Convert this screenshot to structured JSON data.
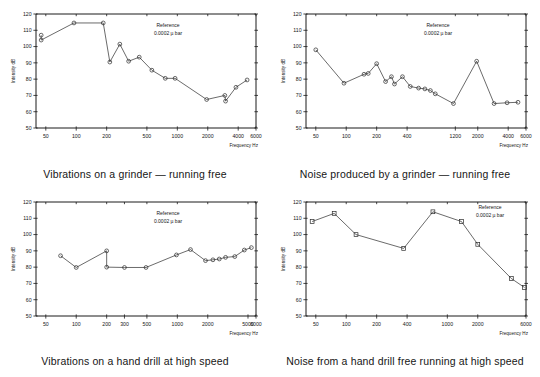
{
  "page": {
    "background": "#ffffff",
    "ink": "#1a1a1a"
  },
  "common": {
    "reference_line1": "Reference",
    "reference_line2": "0.0002 µ bar",
    "x_axis_title": "Frequency Hz",
    "y_axis_title": "Intensity dB"
  },
  "panels": [
    {
      "id": "vibrations-grinder",
      "caption": "Vibrations on a grinder — running free"
    },
    {
      "id": "noise-grinder",
      "caption": "Noise produced by a grinder — running free"
    },
    {
      "id": "vibrations-hand-drill",
      "caption": "Vibrations on a hand drill at high speed"
    },
    {
      "id": "noise-hand-drill",
      "caption": "Noise from a hand drill free running at high speed"
    }
  ],
  "chart_data": [
    {
      "type": "line",
      "title": "Vibrations on a grinder — running free",
      "xlabel": "Frequency Hz",
      "ylabel": "Intensity dB",
      "xscale": "log",
      "xlim": [
        40,
        6000
      ],
      "ylim": [
        50,
        120
      ],
      "yticks": [
        50,
        60,
        70,
        80,
        90,
        100,
        110,
        120
      ],
      "xticks": [
        50,
        100,
        200,
        500,
        1000,
        2000,
        4000,
        6000
      ],
      "xticklabels": [
        "50",
        "100",
        "200",
        "500",
        "1000",
        "2000",
        "4000",
        "6000"
      ],
      "grid": false,
      "legend": null,
      "annotations": [
        "Reference",
        "0.0002 µ bar"
      ],
      "markers": "open-circle",
      "x": [
        45,
        45,
        95,
        185,
        215,
        270,
        330,
        420,
        560,
        760,
        950,
        1950,
        2950,
        3000,
        3800,
        4900
      ],
      "y": [
        107,
        104,
        114.5,
        114.5,
        90.5,
        101.5,
        91,
        93.5,
        85.5,
        80.5,
        80.5,
        67.5,
        70,
        66.5,
        75,
        79.5
      ]
    },
    {
      "type": "line",
      "title": "Noise produced by a grinder — running free",
      "xlabel": "Frequency Hz",
      "ylabel": "Intensity dB",
      "xscale": "log",
      "xlim": [
        40,
        6000
      ],
      "ylim": [
        50,
        120
      ],
      "yticks": [
        50,
        60,
        70,
        80,
        90,
        100,
        110,
        120
      ],
      "xticks": [
        50,
        100,
        200,
        400,
        1200,
        2000,
        4000,
        6000
      ],
      "xticklabels": [
        "50",
        "100",
        "200",
        "400",
        "1200",
        "2000",
        "4000",
        "6000"
      ],
      "grid": false,
      "legend": null,
      "annotations": [
        "Reference",
        "0.0002 µ bar"
      ],
      "markers": "open-circle",
      "x": [
        50,
        95,
        150,
        165,
        200,
        245,
        280,
        300,
        360,
        430,
        520,
        600,
        680,
        760,
        1150,
        1950,
        2900,
        3900,
        5000
      ],
      "y": [
        98,
        77.5,
        83,
        83.5,
        89.5,
        78.5,
        81.5,
        77,
        81.5,
        75.5,
        74.5,
        74,
        73,
        71,
        65,
        91,
        65,
        65.5,
        65.8
      ]
    },
    {
      "type": "line",
      "title": "Vibrations on a hand drill at high speed",
      "xlabel": "Frequency Hz",
      "ylabel": "Intensity dB",
      "xscale": "log",
      "xlim": [
        40,
        6000
      ],
      "ylim": [
        50,
        120
      ],
      "yticks": [
        50,
        60,
        70,
        80,
        90,
        100,
        110,
        120
      ],
      "xticks": [
        50,
        100,
        200,
        300,
        500,
        1000,
        2000,
        5000,
        6000
      ],
      "xticklabels": [
        "50",
        "100",
        "200",
        "300",
        "500",
        "1000",
        "2000",
        "5000",
        "6000"
      ],
      "grid": false,
      "legend": null,
      "annotations": [
        "Reference",
        "0.0002 µ bar"
      ],
      "markers": "open-circle",
      "x": [
        70,
        100,
        200,
        200,
        300,
        490,
        980,
        1350,
        1900,
        2250,
        2600,
        3000,
        3700,
        4600,
        5400
      ],
      "y": [
        87,
        79.8,
        90,
        80,
        79.8,
        79.8,
        87.5,
        90.8,
        84,
        84.5,
        85,
        86,
        86.5,
        90.5,
        92
      ]
    },
    {
      "type": "line",
      "title": "Noise from a hand drill free running at high speed",
      "xlabel": "Frequency Hz",
      "ylabel": "Intensity dB",
      "xscale": "log",
      "xlim": [
        40,
        6000
      ],
      "ylim": [
        50,
        120
      ],
      "yticks": [
        50,
        60,
        70,
        80,
        90,
        100,
        110,
        120
      ],
      "xticks": [
        50,
        100,
        200,
        400,
        1000,
        2000,
        6000
      ],
      "xticklabels": [
        "50",
        "100",
        "200",
        "400",
        "1000",
        "2000",
        "6000"
      ],
      "grid": false,
      "legend": null,
      "annotations": [
        "Reference",
        "0.0002 µ bar"
      ],
      "markers": "open-square",
      "x": [
        46,
        76,
        125,
        370,
        720,
        1380,
        2000,
        4300,
        5800
      ],
      "y": [
        108,
        113,
        100,
        91.5,
        114,
        108,
        94,
        73,
        67.5
      ]
    }
  ]
}
